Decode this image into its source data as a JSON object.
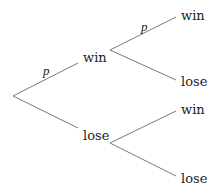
{
  "diagram": {
    "type": "probability-tree",
    "root": {
      "x": 13,
      "y": 96
    },
    "level1": [
      {
        "label": "win",
        "edge_label": "p",
        "edge_from": [
          13,
          96
        ],
        "edge_to": [
          78,
          63
        ],
        "label_pos": [
          83,
          62
        ],
        "edge_label_pos": [
          43,
          75
        ]
      },
      {
        "label": "lose",
        "edge_label": "",
        "edge_from": [
          13,
          96
        ],
        "edge_to": [
          78,
          128
        ],
        "label_pos": [
          83,
          140
        ]
      }
    ],
    "level2": [
      {
        "parent": "win",
        "label": "win",
        "edge_label": "p",
        "edge_from": [
          110,
          50
        ],
        "edge_to": [
          176,
          17
        ],
        "label_pos": [
          181,
          20
        ],
        "edge_label_pos": [
          141,
          31
        ]
      },
      {
        "parent": "win",
        "label": "lose",
        "edge_label": "",
        "edge_from": [
          110,
          50
        ],
        "edge_to": [
          176,
          80
        ],
        "label_pos": [
          181,
          86
        ]
      },
      {
        "parent": "lose",
        "label": "win",
        "edge_label": "",
        "edge_from": [
          110,
          143
        ],
        "edge_to": [
          176,
          111
        ],
        "label_pos": [
          181,
          114
        ]
      },
      {
        "parent": "lose",
        "label": "lose",
        "edge_label": "",
        "edge_from": [
          110,
          143
        ],
        "edge_to": [
          176,
          176
        ],
        "label_pos": [
          181,
          183
        ]
      }
    ],
    "colors": {
      "edge": "#7a7a7a",
      "text": "#222222",
      "background": "#ffffff"
    }
  }
}
